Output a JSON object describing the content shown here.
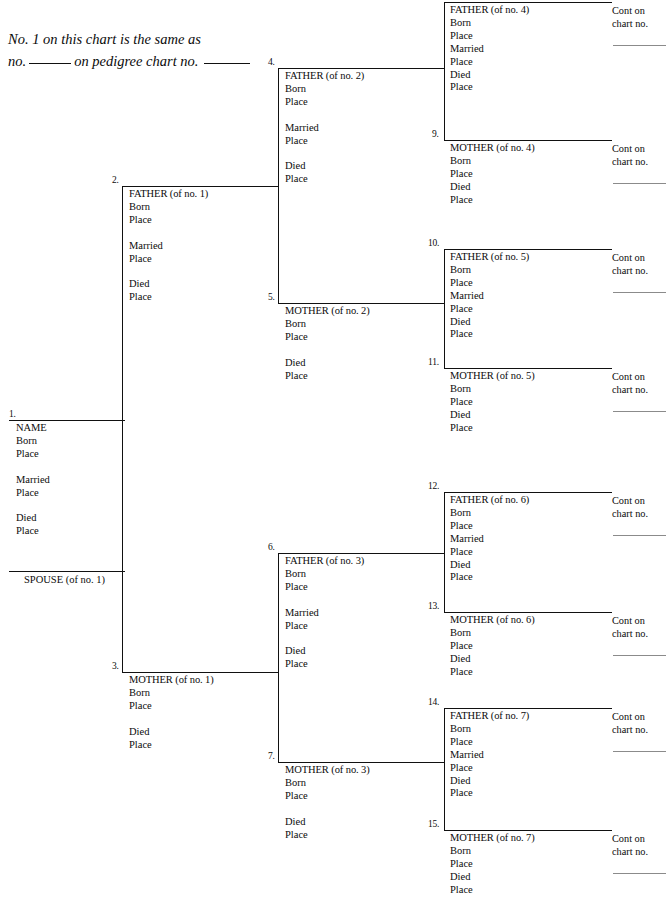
{
  "header": {
    "line1": "No. 1 on this chart is the same as",
    "line2_a": "no.",
    "line2_b": "on pedigree chart no."
  },
  "labels": {
    "born": "Born",
    "place": "Place",
    "married": "Married",
    "died": "Died",
    "cont_line1": "Cont on",
    "cont_line2": "chart no."
  },
  "colors": {
    "ink": "#0b0b0b",
    "rule": "#111111",
    "blank_rule": "#8b8b8b",
    "background": "#ffffff"
  },
  "spouse": {
    "number": "",
    "title": "SPOUSE (of no. 1)"
  },
  "people": [
    {
      "number": "1.",
      "title": "NAME",
      "fields": [
        "Born",
        "Place",
        "",
        "Married",
        "Place",
        "",
        "Died",
        "Place"
      ],
      "cont": false
    },
    {
      "number": "2.",
      "title": "FATHER (of no. 1)",
      "fields": [
        "Born",
        "Place",
        "",
        "Married",
        "Place",
        "",
        "Died",
        "Place"
      ],
      "cont": false
    },
    {
      "number": "3.",
      "title": "MOTHER (of no. 1)",
      "fields": [
        "Born",
        "Place",
        "",
        "Died",
        "Place"
      ],
      "cont": false
    },
    {
      "number": "4.",
      "title": "FATHER (of no. 2)",
      "fields": [
        "Born",
        "Place",
        "",
        "Married",
        "Place",
        "",
        "Died",
        "Place"
      ],
      "cont": false
    },
    {
      "number": "5.",
      "title": "MOTHER (of no. 2)",
      "fields": [
        "Born",
        "Place",
        "",
        "Died",
        "Place"
      ],
      "cont": false
    },
    {
      "number": "6.",
      "title": "FATHER (of no. 3)",
      "fields": [
        "Born",
        "Place",
        "",
        "Married",
        "Place",
        "",
        "Died",
        "Place"
      ],
      "cont": false
    },
    {
      "number": "7.",
      "title": "MOTHER (of no. 3)",
      "fields": [
        "Born",
        "Place",
        "",
        "Died",
        "Place"
      ],
      "cont": false
    },
    {
      "number": "8.",
      "title": "FATHER (of no. 4)",
      "fields": [
        "Born",
        "Place",
        "Married",
        "Place",
        "Died",
        "Place"
      ],
      "cont": true
    },
    {
      "number": "9.",
      "title": "MOTHER (of no. 4)",
      "fields": [
        "Born",
        "Place",
        "Died",
        "Place"
      ],
      "cont": true
    },
    {
      "number": "10.",
      "title": "FATHER (of no. 5)",
      "fields": [
        "Born",
        "Place",
        "Married",
        "Place",
        "Died",
        "Place"
      ],
      "cont": true
    },
    {
      "number": "11.",
      "title": "MOTHER (of no. 5)",
      "fields": [
        "Born",
        "Place",
        "Died",
        "Place"
      ],
      "cont": true
    },
    {
      "number": "12.",
      "title": "FATHER (of no. 6)",
      "fields": [
        "Born",
        "Place",
        "Married",
        "Place",
        "Died",
        "Place"
      ],
      "cont": true
    },
    {
      "number": "13.",
      "title": "MOTHER (of no. 6)",
      "fields": [
        "Born",
        "Place",
        "Died",
        "Place"
      ],
      "cont": true
    },
    {
      "number": "14.",
      "title": "FATHER (of no. 7)",
      "fields": [
        "Born",
        "Place",
        "Married",
        "Place",
        "Died",
        "Place"
      ],
      "cont": true
    },
    {
      "number": "15.",
      "title": "MOTHER (of no. 7)",
      "fields": [
        "Born",
        "Place",
        "Died",
        "Place"
      ],
      "cont": true
    }
  ],
  "layout": {
    "blocks": [
      {
        "id": 0,
        "x": 9,
        "y": 420,
        "w": 116,
        "text_x": 7,
        "num_x": 0,
        "num_dy": -10
      },
      {
        "id": 1,
        "x": 122,
        "y": 186,
        "w": 157,
        "text_x": 7,
        "num_x": -10,
        "num_dy": -10
      },
      {
        "id": 2,
        "x": 122,
        "y": 672,
        "w": 157,
        "text_x": 7,
        "num_x": -10,
        "num_dy": -10
      },
      {
        "id": 3,
        "x": 278,
        "y": 68,
        "w": 166,
        "text_x": 7,
        "num_x": -10,
        "num_dy": -10
      },
      {
        "id": 4,
        "x": 278,
        "y": 303,
        "w": 166,
        "text_x": 7,
        "num_x": -10,
        "num_dy": -10
      },
      {
        "id": 5,
        "x": 278,
        "y": 553,
        "w": 166,
        "text_x": 7,
        "num_x": -10,
        "num_dy": -10
      },
      {
        "id": 6,
        "x": 278,
        "y": 762,
        "w": 166,
        "text_x": 7,
        "num_x": -10,
        "num_dy": -10
      },
      {
        "id": 7,
        "x": 444,
        "y": 2,
        "w": 168,
        "text_x": 6,
        "num_x": -12,
        "num_dy": -10
      },
      {
        "id": 8,
        "x": 444,
        "y": 140,
        "w": 168,
        "text_x": 6,
        "num_x": -12,
        "num_dy": -10
      },
      {
        "id": 9,
        "x": 444,
        "y": 249,
        "w": 168,
        "text_x": 6,
        "num_x": -16,
        "num_dy": -10
      },
      {
        "id": 10,
        "x": 444,
        "y": 368,
        "w": 168,
        "text_x": 6,
        "num_x": -16,
        "num_dy": -10
      },
      {
        "id": 11,
        "x": 444,
        "y": 492,
        "w": 168,
        "text_x": 6,
        "num_x": -16,
        "num_dy": -10
      },
      {
        "id": 12,
        "x": 444,
        "y": 612,
        "w": 168,
        "text_x": 6,
        "num_x": -16,
        "num_dy": -10
      },
      {
        "id": 13,
        "x": 444,
        "y": 708,
        "w": 168,
        "text_x": 6,
        "num_x": -16,
        "num_dy": -10
      },
      {
        "id": 14,
        "x": 444,
        "y": 830,
        "w": 168,
        "text_x": 6,
        "num_x": -16,
        "num_dy": -10
      }
    ],
    "connectors": [
      {
        "name": "gen2-trunk",
        "type": "v",
        "x": 122,
        "y": 186,
        "len": 486
      },
      {
        "name": "gen2-stub",
        "type": "h",
        "x": 86,
        "y": 420,
        "len": 36
      },
      {
        "name": "gen3-trunk-top",
        "type": "v",
        "x": 278,
        "y": 68,
        "len": 235
      },
      {
        "name": "gen3-stub-top",
        "type": "h",
        "x": 246,
        "y": 186,
        "len": 33
      },
      {
        "name": "gen3-trunk-bot",
        "type": "v",
        "x": 278,
        "y": 553,
        "len": 209
      },
      {
        "name": "gen3-stub-bot",
        "type": "h",
        "x": 246,
        "y": 672,
        "len": 33
      },
      {
        "name": "gen4-trunk-1",
        "type": "v",
        "x": 444,
        "y": 2,
        "len": 138
      },
      {
        "name": "gen4-stub-1",
        "type": "h",
        "x": 414,
        "y": 68,
        "len": 31
      },
      {
        "name": "gen4-trunk-2",
        "type": "v",
        "x": 444,
        "y": 249,
        "len": 119
      },
      {
        "name": "gen4-stub-2",
        "type": "h",
        "x": 414,
        "y": 303,
        "len": 31
      },
      {
        "name": "gen4-trunk-3",
        "type": "v",
        "x": 444,
        "y": 492,
        "len": 120
      },
      {
        "name": "gen4-stub-3",
        "type": "h",
        "x": 414,
        "y": 553,
        "len": 31
      },
      {
        "name": "gen4-trunk-4",
        "type": "v",
        "x": 444,
        "y": 708,
        "len": 122
      },
      {
        "name": "gen4-stub-4",
        "type": "h",
        "x": 414,
        "y": 762,
        "len": 31
      }
    ]
  }
}
